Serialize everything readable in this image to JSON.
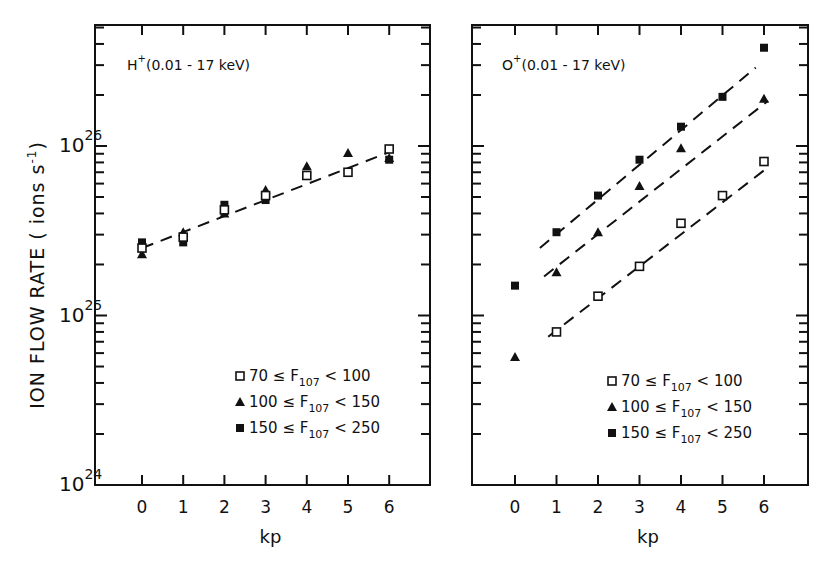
{
  "figure": {
    "ylabel": "ION FLOW RATE ( ions s",
    "ylabel_sup": "-1",
    "ylabel_close": ")",
    "y_ticks": [
      {
        "base": "10",
        "exp": "24",
        "log": 24
      },
      {
        "base": "10",
        "exp": "25",
        "log": 25
      },
      {
        "base": "10",
        "exp": "26",
        "log": 26
      }
    ],
    "xlabel": "kp",
    "x_ticks": [
      "0",
      "1",
      "2",
      "3",
      "4",
      "5",
      "6"
    ]
  },
  "legend": [
    {
      "marker": "open-square",
      "label_pre": "70 ≤ F",
      "sub": "107",
      "label_post": " < 100"
    },
    {
      "marker": "filled-triangle",
      "label_pre": "100 ≤ F",
      "sub": "107",
      "label_post": " < 150"
    },
    {
      "marker": "filled-square",
      "label_pre": "150 ≤ F",
      "sub": "107",
      "label_post": " < 250"
    }
  ],
  "chart_data": [
    {
      "type": "scatter",
      "title": "H+ (0.01-17 keV)",
      "title_ion": "H",
      "title_sup": "+",
      "title_range": "(0.01 - 17 keV)",
      "xlabel": "kp",
      "ylabel": "ION FLOW RATE (ions s^-1)",
      "yscale": "log",
      "ylim": [
        1e+24,
        5e+26
      ],
      "xlim": [
        -1,
        7
      ],
      "grid": false,
      "legend_position": "lower right",
      "x": [
        0,
        1,
        2,
        3,
        4,
        5,
        6
      ],
      "series": [
        {
          "name": "70 ≤ F107 < 100",
          "marker": "open-square",
          "values": [
            2.5e+25,
            2.9e+25,
            4.2e+25,
            5.1e+25,
            6.7e+25,
            7e+25,
            9.6e+25
          ]
        },
        {
          "name": "100 ≤ F107 < 150",
          "marker": "filled-triangle",
          "values": [
            2.3e+25,
            3.1e+25,
            4e+25,
            5.5e+25,
            7.6e+25,
            9.1e+25,
            8.5e+25
          ]
        },
        {
          "name": "150 ≤ F107 < 250",
          "marker": "filled-square",
          "values": [
            2.7e+25,
            2.7e+25,
            4.5e+25,
            4.8e+25,
            null,
            null,
            8.3e+25
          ]
        }
      ],
      "fit_lines": [
        {
          "name": "all",
          "from": [
            0,
            2.5e+25
          ],
          "to": [
            6.1,
            9.4e+25
          ]
        }
      ]
    },
    {
      "type": "scatter",
      "title": "O+ (0.01-17 keV)",
      "title_ion": "O",
      "title_sup": "+",
      "title_range": "(0.01 - 17 keV)",
      "xlabel": "kp",
      "ylabel": "ION FLOW RATE (ions s^-1)",
      "yscale": "log",
      "ylim": [
        1e+24,
        5e+26
      ],
      "xlim": [
        -1,
        7
      ],
      "grid": false,
      "legend_position": "lower right",
      "x": [
        0,
        1,
        2,
        3,
        4,
        5,
        6
      ],
      "series": [
        {
          "name": "70 ≤ F107 < 100",
          "marker": "open-square",
          "values": [
            null,
            8e+24,
            1.3e+25,
            1.95e+25,
            3.5e+25,
            5.1e+25,
            8.1e+25
          ]
        },
        {
          "name": "100 ≤ F107 < 150",
          "marker": "filled-triangle",
          "values": [
            5.7e+24,
            1.8e+25,
            3.1e+25,
            5.8e+25,
            9.7e+25,
            null,
            1.9e+26
          ]
        },
        {
          "name": "150 ≤ F107 < 250",
          "marker": "filled-square",
          "values": [
            1.5e+25,
            3.1e+25,
            5.1e+25,
            8.3e+25,
            1.3e+26,
            1.95e+26,
            3.8e+26
          ]
        }
      ],
      "fit_lines": [
        {
          "name": "150 ≤ F107 < 250",
          "from": [
            0.6,
            2.5e+25
          ],
          "to": [
            5.8,
            2.9e+26
          ]
        },
        {
          "name": "100 ≤ F107 < 150",
          "from": [
            0.7,
            1.7e+25
          ],
          "to": [
            6.1,
            1.85e+26
          ]
        },
        {
          "name": "70 ≤ F107 < 100",
          "from": [
            0.8,
            7.5e+24
          ],
          "to": [
            6.1,
            7.5e+25
          ]
        }
      ]
    }
  ]
}
